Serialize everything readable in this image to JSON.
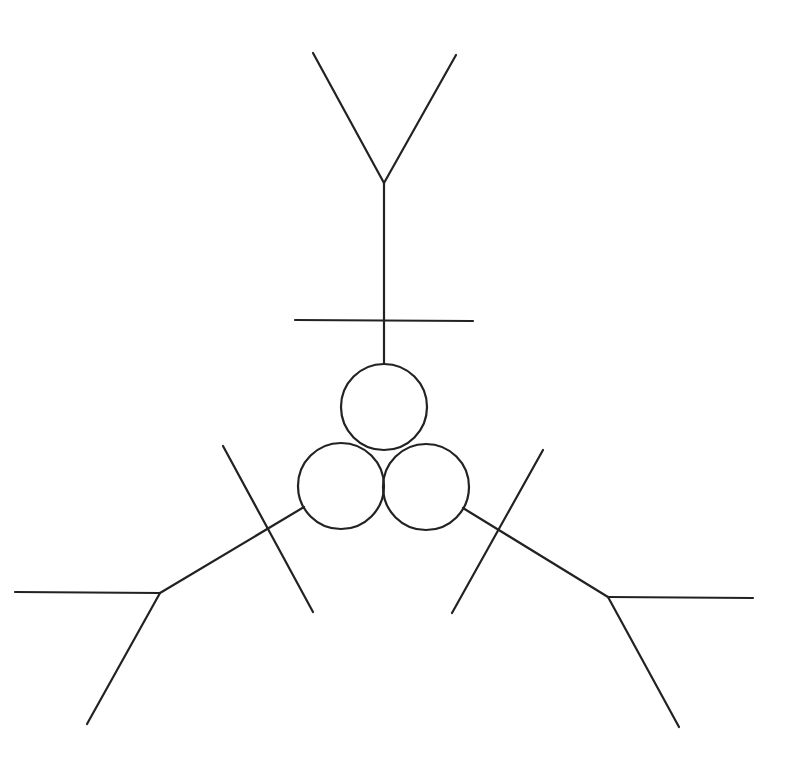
{
  "diagram": {
    "stroke_color": "#222222",
    "background": "#ffffff",
    "circles": [
      {
        "name": "top-coil",
        "cx": 384,
        "cy": 407,
        "r": 43
      },
      {
        "name": "left-coil",
        "cx": 341,
        "cy": 486,
        "r": 43
      },
      {
        "name": "right-coil",
        "cx": 426,
        "cy": 487,
        "r": 43
      }
    ],
    "branches": {
      "top": {
        "stem": [
          384,
          364,
          384,
          183
        ],
        "fork_left": [
          384,
          183,
          313,
          53
        ],
        "fork_right": [
          384,
          183,
          456,
          55
        ],
        "crossbar": [
          295,
          320,
          473,
          321
        ]
      },
      "left": {
        "stem": [
          304,
          507,
          160,
          593
        ],
        "fork_horizontal": [
          160,
          593,
          15,
          592
        ],
        "fork_down": [
          160,
          593,
          87,
          724
        ],
        "crossbar": [
          223,
          446,
          313,
          612
        ]
      },
      "right": {
        "stem": [
          463,
          508,
          608,
          597
        ],
        "fork_horizontal": [
          608,
          597,
          753,
          598
        ],
        "fork_down": [
          608,
          597,
          679,
          727
        ],
        "crossbar": [
          543,
          450,
          452,
          613
        ]
      }
    }
  }
}
